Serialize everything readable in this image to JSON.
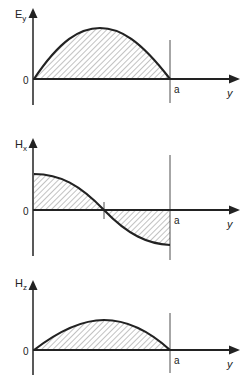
{
  "diagram": {
    "panels": [
      {
        "quantity": "E",
        "subscript": "y",
        "origin_label": "0",
        "end_label": "a",
        "axis_label": "y",
        "shape": "half-sine (positive)"
      },
      {
        "quantity": "H",
        "subscript": "x",
        "origin_label": "0",
        "end_label": "a",
        "axis_label": "y",
        "shape": "cosine (positive to negative)"
      },
      {
        "quantity": "H",
        "subscript": "z",
        "origin_label": "0",
        "end_label": "a",
        "axis_label": "y",
        "shape": "half-sine (positive, smaller)"
      }
    ]
  }
}
